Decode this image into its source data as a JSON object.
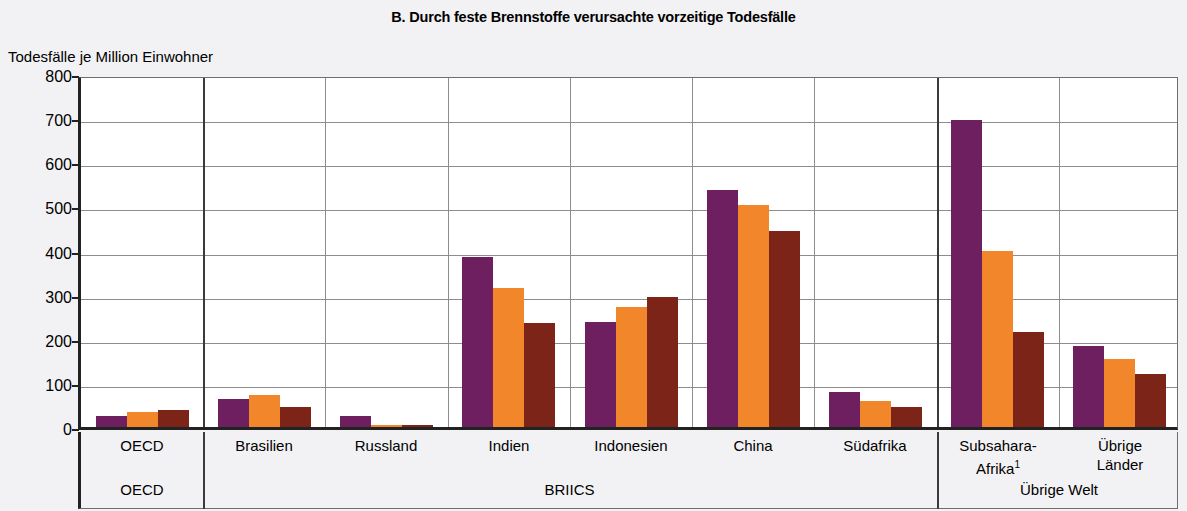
{
  "title": "B. Durch feste Brennstoffe verursachte vorzeitige Todesfälle",
  "y_axis_caption": "Todesfälle je Million Einwohner",
  "footnote_marker": "1",
  "colors": {
    "series_0": "#6d1f5f",
    "series_1": "#f2862b",
    "series_2": "#7b2417",
    "grid": "#8d8d8d",
    "axis": "#222222",
    "page_background": "#f2f2f4",
    "plot_background": "#ffffff"
  },
  "groups": [
    {
      "label": "OECD",
      "members": [
        "OECD"
      ]
    },
    {
      "label": "BRIICS",
      "members": [
        "Brasilien",
        "Russland",
        "Indien",
        "Indonesien",
        "China",
        "Südafrika"
      ]
    },
    {
      "label": "Übrige Welt",
      "members": [
        "Subsahara-Afrika",
        "Übrige Länder"
      ]
    }
  ],
  "chart_data": {
    "type": "bar",
    "title": "B. Durch feste Brennstoffe verursachte vorzeitige Todesfälle",
    "xlabel": "",
    "ylabel": "Todesfälle je Million Einwohner",
    "ylim": [
      0,
      800
    ],
    "yticks": [
      0,
      100,
      200,
      300,
      400,
      500,
      600,
      700,
      800
    ],
    "grid": true,
    "legend": "none",
    "categories": [
      "OECD",
      "Brasilien",
      "Russland",
      "Indien",
      "Indonesien",
      "China",
      "Südafrika",
      "Subsahara-Afrika",
      "Übrige Länder"
    ],
    "series": [
      {
        "name": "series-1",
        "color": "#6d1f5f",
        "values": [
          25,
          65,
          26,
          388,
          239,
          542,
          80,
          702,
          186
        ]
      },
      {
        "name": "series-2",
        "color": "#f2862b",
        "values": [
          35,
          72,
          3,
          317,
          274,
          508,
          60,
          402,
          156
        ]
      },
      {
        "name": "series-3",
        "color": "#7b2417",
        "values": [
          38,
          46,
          3,
          237,
          297,
          447,
          45,
          216,
          120
        ]
      }
    ],
    "group_bands": [
      {
        "label": "OECD",
        "categories": [
          "OECD"
        ]
      },
      {
        "label": "BRIICS",
        "categories": [
          "Brasilien",
          "Russland",
          "Indien",
          "Indonesien",
          "China",
          "Südafrika"
        ]
      },
      {
        "label": "Übrige Welt",
        "categories": [
          "Subsahara-Afrika",
          "Übrige Länder"
        ]
      }
    ]
  },
  "category_labels": [
    {
      "text": "OECD",
      "lines": [
        "OECD"
      ],
      "superscript": ""
    },
    {
      "text": "Brasilien",
      "lines": [
        "Brasilien"
      ],
      "superscript": ""
    },
    {
      "text": "Russland",
      "lines": [
        "Russland"
      ],
      "superscript": ""
    },
    {
      "text": "Indien",
      "lines": [
        "Indien"
      ],
      "superscript": ""
    },
    {
      "text": "Indonesien",
      "lines": [
        "Indonesien"
      ],
      "superscript": ""
    },
    {
      "text": "China",
      "lines": [
        "China"
      ],
      "superscript": ""
    },
    {
      "text": "Südafrika",
      "lines": [
        "Südafrika"
      ],
      "superscript": ""
    },
    {
      "text": "Subsahara-Afrika",
      "lines": [
        "Subsahara-",
        "Afrika"
      ],
      "superscript": "1"
    },
    {
      "text": "Übrige Länder",
      "lines": [
        "Übrige",
        "Länder"
      ],
      "superscript": ""
    }
  ]
}
